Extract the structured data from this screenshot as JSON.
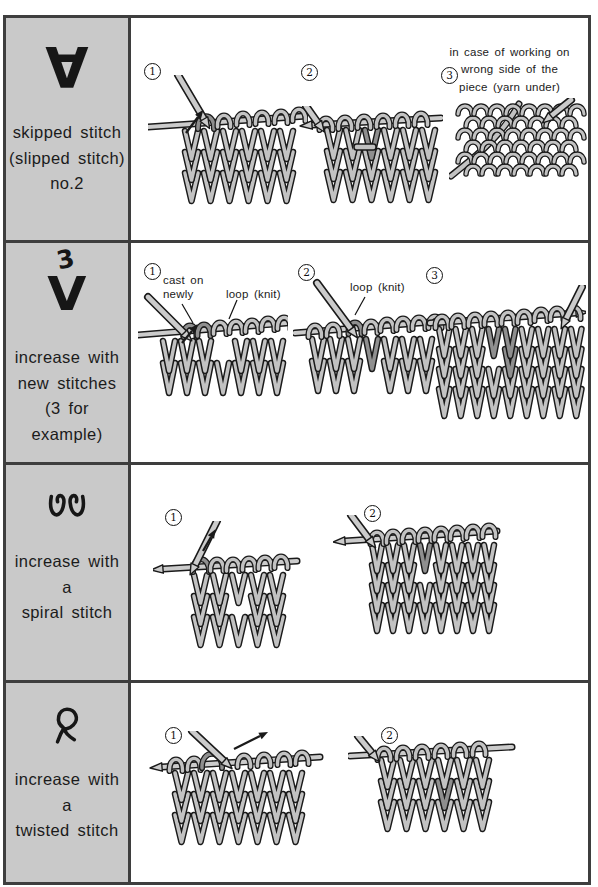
{
  "colors": {
    "border": "#3e3e3e",
    "sidebar_bg": "#c9c9c9",
    "ink": "#1a1a1a",
    "stitch": "#c2c2c2",
    "stitch_dark": "#8f8f8f",
    "needle": "#cbcbcb",
    "paper": "#ffffff"
  },
  "rows": [
    {
      "symbol": "∀",
      "symbol_name": "skipped-stitch-symbol",
      "title_lines": [
        "skipped stitch",
        "(slipped stitch)",
        "no.2"
      ],
      "steps": [
        {
          "num": "1"
        },
        {
          "num": "2"
        },
        {
          "num": "3",
          "note_lines": [
            "in case of working on",
            "wrong side of the",
            "piece (yarn under)"
          ]
        }
      ]
    },
    {
      "symbol_v": "V",
      "symbol_3": "3",
      "symbol_name": "increase-3-stitches-symbol",
      "title_lines": [
        "increase with",
        "new stitches",
        "(3 for example)"
      ],
      "steps": [
        {
          "num": "1",
          "labels": {
            "cast_on_line1": "cast on",
            "cast_on_line2": "newly",
            "loop": "loop (knit)"
          }
        },
        {
          "num": "2",
          "labels": {
            "loop": "loop (knit)"
          }
        },
        {
          "num": "3"
        }
      ]
    },
    {
      "symbol_name": "spiral-stitch-symbol",
      "title_lines": [
        "increase with a",
        "spiral stitch"
      ],
      "steps": [
        {
          "num": "1"
        },
        {
          "num": "2"
        }
      ]
    },
    {
      "symbol_name": "twisted-stitch-symbol",
      "title_lines": [
        "increase with a",
        "twisted stitch"
      ],
      "steps": [
        {
          "num": "1"
        },
        {
          "num": "2"
        }
      ]
    }
  ]
}
